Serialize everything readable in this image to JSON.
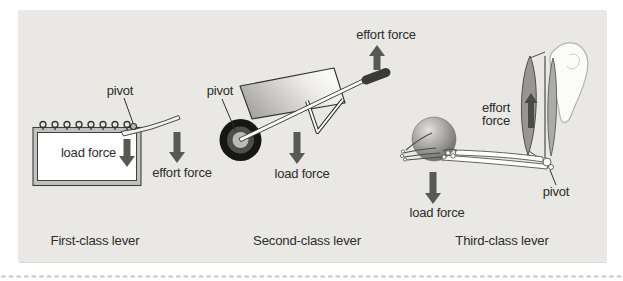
{
  "figure": {
    "kind": "lever-classes-diagram",
    "colors": {
      "panel_background": "#e9e8e4",
      "arrow": "#585854",
      "text": "#2d2d2b",
      "dotted_border": "#c8c7c3"
    }
  },
  "diagrams": [
    {
      "caption": "First-class lever",
      "labels": {
        "pivot": "pivot",
        "load": "load force",
        "effort": "effort force"
      }
    },
    {
      "caption": "Second-class lever",
      "labels": {
        "pivot": "pivot",
        "load": "load force",
        "effort": "effort force"
      }
    },
    {
      "caption": "Third-class lever",
      "labels": {
        "pivot": "pivot",
        "load": "load force",
        "effort_lines": [
          "effort",
          "force"
        ]
      }
    }
  ]
}
